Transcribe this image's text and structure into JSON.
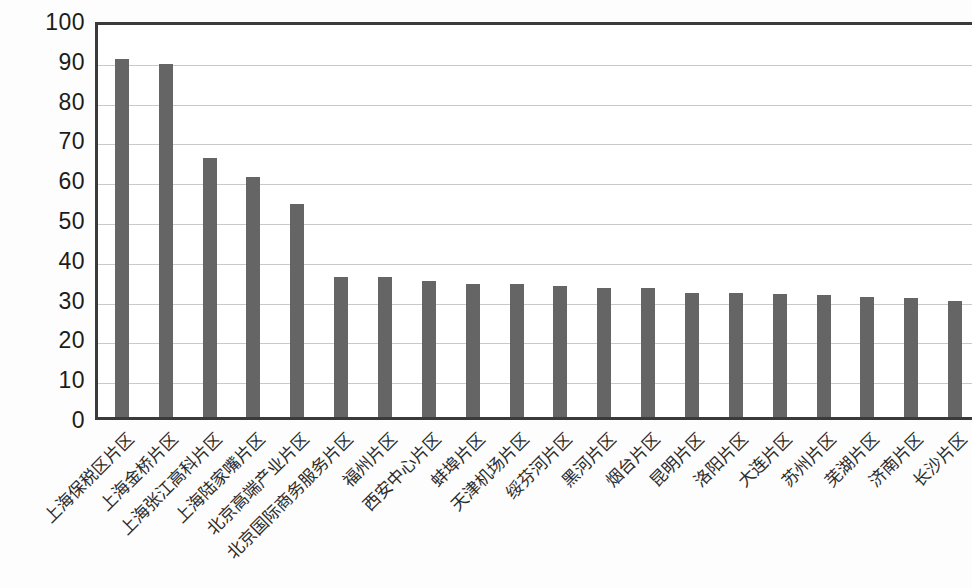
{
  "chart_data": {
    "type": "bar",
    "title": "",
    "subtitle": "",
    "xlabel": "",
    "ylabel": "",
    "ylim": [
      0,
      100
    ],
    "y_ticks": [
      0,
      10,
      20,
      30,
      40,
      50,
      60,
      70,
      80,
      90,
      100
    ],
    "grid": true,
    "legend": false,
    "legend_position": "none",
    "bar_color": "#656565",
    "axis_color": "#3a3a3a",
    "gridline_color": "#c9c9c9",
    "x_label_rotation": -45,
    "categories": [
      "上海保税区片区",
      "上海金桥片区",
      "上海张江高科片区",
      "上海陆家嘴片区",
      "北京高端产业片区",
      "北京国际商务服务片区",
      "福州片区",
      "西安中心片区",
      "蚌埠片区",
      "天津机场片区",
      "绥芬河片区",
      "黑河片区",
      "烟台片区",
      "昆明片区",
      "洛阳片区",
      "大连片区",
      "苏州片区",
      "芜湖片区",
      "济南片区",
      "长沙片区"
    ],
    "values": [
      90.0,
      88.6,
      65.0,
      60.3,
      53.5,
      35.3,
      35.1,
      34.2,
      33.4,
      33.3,
      32.8,
      32.5,
      32.3,
      31.2,
      31.1,
      30.8,
      30.7,
      30.2,
      30.0,
      29.2
    ]
  }
}
